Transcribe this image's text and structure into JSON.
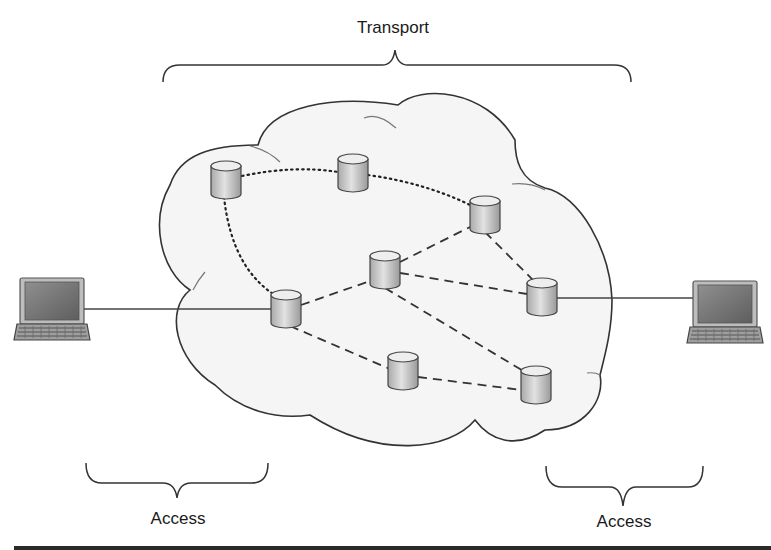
{
  "diagram": {
    "labels": {
      "transport": "Transport",
      "access_left": "Access",
      "access_right": "Access"
    },
    "colors": {
      "cloud_fill": "#f5f5f5",
      "cloud_stroke": "#333333",
      "node_body": "#c8c8c8",
      "node_top": "#ebebeb",
      "line": "#333333",
      "bottom_bar": "#2a2a2a"
    },
    "nodes": [
      {
        "id": "n1",
        "x": 226,
        "y": 180
      },
      {
        "id": "n2",
        "x": 353,
        "y": 173
      },
      {
        "id": "n3",
        "x": 485,
        "y": 215
      },
      {
        "id": "n4",
        "x": 385,
        "y": 270
      },
      {
        "id": "n5",
        "x": 286,
        "y": 309
      },
      {
        "id": "n6",
        "x": 542,
        "y": 297
      },
      {
        "id": "n7",
        "x": 403,
        "y": 371
      },
      {
        "id": "n8",
        "x": 536,
        "y": 385
      }
    ],
    "links": [
      {
        "from": "n1",
        "to": "n2",
        "style": "dotted"
      },
      {
        "from": "n2",
        "to": "n3",
        "style": "dotted"
      },
      {
        "from": "n1",
        "to": "n5",
        "style": "dotted"
      },
      {
        "from": "n5",
        "to": "n4",
        "style": "dashed"
      },
      {
        "from": "n4",
        "to": "n3",
        "style": "dashed"
      },
      {
        "from": "n4",
        "to": "n6",
        "style": "dashed"
      },
      {
        "from": "n3",
        "to": "n6",
        "style": "dashed"
      },
      {
        "from": "n4",
        "to": "n8",
        "style": "dashed"
      },
      {
        "from": "n5",
        "to": "n7",
        "style": "dashed"
      },
      {
        "from": "n7",
        "to": "n8",
        "style": "dashed"
      },
      {
        "from": "laptop-left",
        "to": "n5",
        "style": "solid"
      },
      {
        "from": "n6",
        "to": "laptop-right",
        "style": "solid"
      }
    ],
    "endpoints": [
      {
        "id": "laptop-left",
        "icon": "laptop-icon"
      },
      {
        "id": "laptop-right",
        "icon": "laptop-icon"
      }
    ]
  }
}
